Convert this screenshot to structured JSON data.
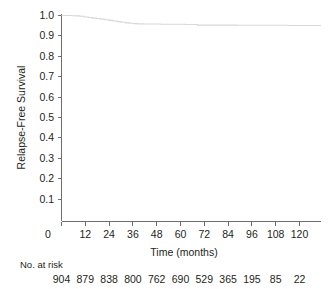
{
  "chart_data": {
    "type": "line",
    "title": "",
    "xlabel": "Time (months)",
    "ylabel": "Relapse-Free Survival",
    "xlim": [
      0,
      126
    ],
    "ylim": [
      0,
      1.03
    ],
    "grid": false,
    "legend": null,
    "x_ticks": [
      0,
      12,
      24,
      36,
      48,
      60,
      72,
      84,
      96,
      108,
      120
    ],
    "x_tick_labels": [
      "0",
      "12",
      "24",
      "36",
      "48",
      "60",
      "72",
      "84",
      "96",
      "108",
      "120"
    ],
    "y_ticks": [
      0.1,
      0.2,
      0.3,
      0.4,
      0.5,
      0.6,
      0.7,
      0.8,
      0.9,
      1.0
    ],
    "y_tick_labels": [
      "0.1",
      "0.2",
      "0.3",
      "0.4",
      "0.5",
      "0.6",
      "0.7",
      "0.8",
      "0.9",
      "1.0"
    ],
    "series": [
      {
        "name": "Relapse-Free Survival",
        "color": "#d8d8d8",
        "style": "kaplan-meier-step",
        "x": [
          0,
          3,
          5,
          7,
          9,
          11,
          13,
          15,
          17,
          19,
          21,
          23,
          25,
          27,
          29,
          31,
          33,
          35,
          37,
          40,
          44,
          48,
          52,
          56,
          60,
          64,
          66,
          70,
          75,
          80,
          85,
          90,
          95,
          100,
          105,
          110,
          115,
          120,
          126
        ],
        "y": [
          1.0,
          1.0,
          0.999,
          0.998,
          0.996,
          0.993,
          0.99,
          0.987,
          0.985,
          0.982,
          0.979,
          0.976,
          0.973,
          0.97,
          0.967,
          0.964,
          0.962,
          0.96,
          0.959,
          0.958,
          0.958,
          0.957,
          0.957,
          0.957,
          0.956,
          0.956,
          0.953,
          0.953,
          0.953,
          0.953,
          0.952,
          0.952,
          0.952,
          0.952,
          0.952,
          0.951,
          0.951,
          0.951,
          0.951
        ]
      }
    ],
    "risk_table": {
      "heading": "No. at risk",
      "times": [
        0,
        12,
        24,
        36,
        48,
        60,
        72,
        84,
        96,
        108,
        120
      ],
      "values": [
        "904",
        "879",
        "838",
        "800",
        "762",
        "690",
        "529",
        "365",
        "195",
        "85",
        "22"
      ]
    }
  },
  "colors": {
    "axis": "#6d6e71",
    "text": "#231f20",
    "curve": "#d8d8d8",
    "background": "#ffffff"
  }
}
